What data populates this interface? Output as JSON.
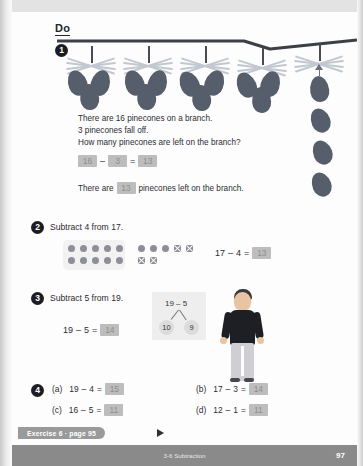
{
  "page": {
    "header_label": "Do",
    "footer_exercise": "Exercise 6 · page 95",
    "footer_chapter": "3-6 Subtraction",
    "page_number": "97",
    "accent_dark": "#1b1d22",
    "answer_box_color": "#bdbdbd",
    "cone_color": "#575e6b"
  },
  "problems": [
    {
      "number": "1",
      "lines": [
        "There are 16 pinecones on a branch.",
        "3 pinecones fall off.",
        "How many pinecones are left on the branch?"
      ],
      "equation": {
        "a": "16",
        "op": "–",
        "b": "3",
        "eq": "=",
        "answer": "13"
      },
      "sentence_before": "There are",
      "sentence_answer": "13",
      "sentence_after": "pinecones left on the branch.",
      "art": {
        "clusters": 4,
        "cones_per_cluster": 3,
        "hanging_cones": 1,
        "falling_cones": 3,
        "total_cones": "16"
      }
    },
    {
      "number": "2",
      "prompt": "Subtract 4 from 17.",
      "frame_left_dots": 10,
      "frame_right_plain": 3,
      "frame_right_crossed": 4,
      "equation": {
        "a": "17",
        "op": "–",
        "b": "4",
        "eq": "=",
        "answer": "13"
      }
    },
    {
      "number": "3",
      "prompt": "Subtract 5 from 19.",
      "equation": {
        "a": "19",
        "op": "–",
        "b": "5",
        "eq": "=",
        "answer": "14"
      },
      "bond": {
        "top": "19 – 5",
        "left": "10",
        "right": "9"
      }
    },
    {
      "number": "4",
      "items": [
        {
          "label": "(a)",
          "a": "19",
          "op": "–",
          "b": "4",
          "eq": "=",
          "answer": "15"
        },
        {
          "label": "(b)",
          "a": "17",
          "op": "–",
          "b": "3",
          "eq": "=",
          "answer": "14"
        },
        {
          "label": "(c)",
          "a": "16",
          "op": "–",
          "b": "5",
          "eq": "=",
          "answer": "11"
        },
        {
          "label": "(d)",
          "a": "12",
          "op": "–",
          "b": "1",
          "eq": "=",
          "answer": "11"
        }
      ]
    }
  ]
}
